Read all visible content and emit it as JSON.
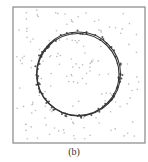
{
  "panel": {
    "caption": "(b)",
    "frame": {
      "x": 13,
      "y": 7,
      "width": 132,
      "height": 136,
      "stroke": "#888888"
    },
    "colors": {
      "background": "#ffffff",
      "frame": "#888888",
      "curve": "#333333",
      "points": "#555555",
      "noise": "#bbbbbb"
    }
  },
  "chart_data": {
    "type": "scatter",
    "title": "",
    "caption": "(b)",
    "fitted_circles": [
      {
        "name": "fit",
        "cx": 78.5,
        "cy": 74,
        "r": 42
      },
      {
        "name": "ground-truth",
        "cx": 78,
        "cy": 74.5,
        "r": 41
      }
    ],
    "grid": false,
    "legend": false,
    "xlabel": "",
    "ylabel": ""
  }
}
